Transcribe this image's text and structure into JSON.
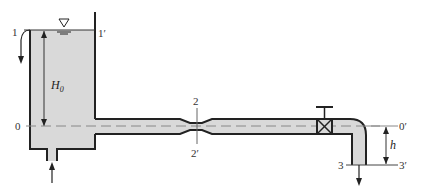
{
  "diagram": {
    "type": "tank-pipe-flow-system",
    "colors": {
      "fluid": "#d9d9d9",
      "wall": "#222222",
      "centerline": "#888888",
      "text": "#333333",
      "background": "#ffffff"
    },
    "labels": {
      "section_1": "1",
      "section_1_prime": "1′",
      "section_0": "0",
      "section_0_prime": "0′",
      "section_2": "2",
      "section_2_prime": "2′",
      "section_3": "3",
      "section_3_prime": "3′",
      "head_symbol": "H",
      "head_subscript": "0",
      "height_symbol": "h"
    },
    "components": [
      "reservoir-tank",
      "free-surface-marker",
      "overflow-outlet",
      "bottom-inlet",
      "horizontal-pipe",
      "venturi-throat",
      "gate-valve",
      "elbow-bend",
      "vertical-outlet-pipe"
    ]
  }
}
